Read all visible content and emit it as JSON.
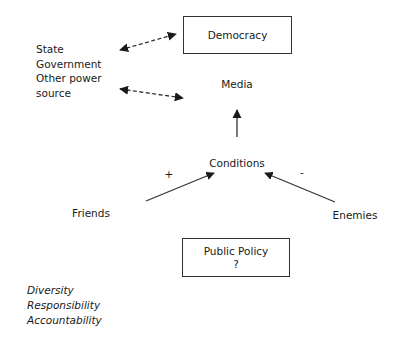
{
  "diagram": {
    "top_box": {
      "label": "Democracy"
    },
    "left_list": [
      "State",
      "Government",
      "Other power",
      "source"
    ],
    "media_label": "Media",
    "conditions_label": "Conditions",
    "plus_sign": "+",
    "minus_sign": "-",
    "friends_label": "Friends",
    "enemies_label": "Enemies",
    "bottom_box": {
      "label": "Public Policy",
      "sub": "?"
    },
    "values_list": [
      "Diversity",
      "Responsibility",
      "Accountability"
    ],
    "edges": [
      {
        "from": "State/Government/Other power source",
        "to": "Democracy",
        "style": "dashed",
        "direction": "both"
      },
      {
        "from": "State/Government/Other power source",
        "to": "Media",
        "style": "dashed",
        "direction": "both"
      },
      {
        "from": "Conditions",
        "to": "Media",
        "style": "solid",
        "direction": "forward"
      },
      {
        "from": "Friends",
        "to": "Conditions",
        "style": "solid",
        "direction": "forward",
        "sign": "+"
      },
      {
        "from": "Enemies",
        "to": "Conditions",
        "style": "solid",
        "direction": "forward",
        "sign": "-"
      }
    ],
    "colors": {
      "stroke": "#333333",
      "text": "#1a1a1a",
      "background": "#ffffff"
    }
  }
}
